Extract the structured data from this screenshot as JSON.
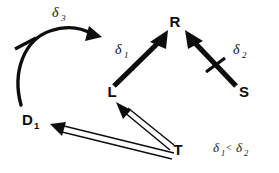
{
  "diagram": {
    "background_color": "#ffffff",
    "ink_color": "#0d0d0d",
    "nodes": [
      {
        "id": "R",
        "label": "R",
        "subscript": "",
        "x": 175,
        "y": 27
      },
      {
        "id": "L",
        "label": "L",
        "subscript": "",
        "x": 112,
        "y": 97
      },
      {
        "id": "D1",
        "label": "D",
        "subscript": "1",
        "x": 30,
        "y": 125
      },
      {
        "id": "T",
        "label": "T",
        "subscript": "",
        "x": 178,
        "y": 155
      },
      {
        "id": "S",
        "label": "S",
        "subscript": "",
        "x": 244,
        "y": 97
      }
    ],
    "edges": [
      {
        "id": "d1-curve",
        "from": "D1",
        "to": "L",
        "style": "curved-arc",
        "label": "δ",
        "label_subscript": "3",
        "label_x": 52,
        "label_y": 17,
        "has_tick": true
      },
      {
        "id": "l-to-r",
        "from": "L",
        "to": "R",
        "style": "thick-solid",
        "label": "δ",
        "label_subscript": "1",
        "label_x": 122,
        "label_y": 54,
        "has_tick": false
      },
      {
        "id": "s-to-r",
        "from": "S",
        "to": "R",
        "style": "thick-solid",
        "label": "δ",
        "label_subscript": "2",
        "label_x": 238,
        "label_y": 54,
        "has_tick": true
      },
      {
        "id": "t-to-l",
        "from": "T",
        "to": "L",
        "style": "double-line",
        "label": "",
        "label_subscript": "",
        "has_tick": false
      },
      {
        "id": "t-to-d1",
        "from": "T",
        "to": "D1",
        "style": "double-line",
        "label": "",
        "label_subscript": "",
        "has_tick": false
      }
    ],
    "annotation": {
      "id": "inequality-note",
      "left_symbol": "δ",
      "left_subscript": "1",
      "operator": "<",
      "right_symbol": "δ",
      "right_subscript": "2",
      "x": 219,
      "y": 152
    }
  }
}
